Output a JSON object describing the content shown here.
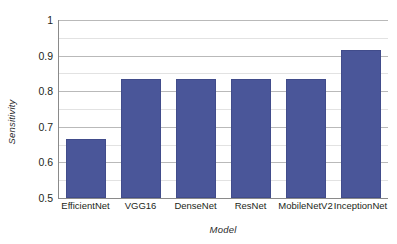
{
  "chart_data": {
    "type": "bar",
    "title": "",
    "xlabel": "Model",
    "ylabel": "Sensitivity",
    "categories": [
      "EfficientNet",
      "VGG16",
      "DenseNet",
      "ResNet",
      "MobileNetV2",
      "InceptionNet"
    ],
    "values": [
      0.667,
      0.833,
      0.833,
      0.833,
      0.833,
      0.917
    ],
    "ylim": [
      0.5,
      1.0
    ],
    "yticks": [
      0.5,
      0.6,
      0.7,
      0.8,
      0.9,
      1.0
    ],
    "ytick_labels": [
      "0.5",
      "0.6",
      "0.7",
      "0.8",
      "0.9",
      "1"
    ],
    "minor_yticks": [
      0.55,
      0.65,
      0.75,
      0.85,
      0.95
    ],
    "grid": true,
    "legend": false,
    "bar_color": "#4a5699",
    "major_gridline_color": "#b9b9b9",
    "minor_gridline_color": "#e2e2e2",
    "axis_color": "#8a8a8a",
    "background_color": "#ffffff"
  }
}
